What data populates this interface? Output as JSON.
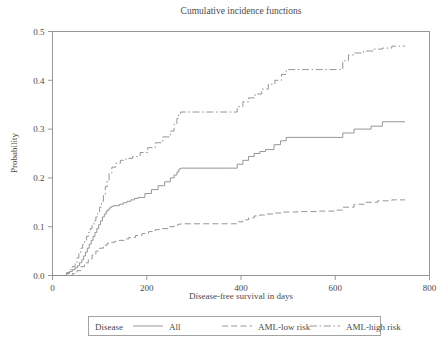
{
  "chart_data": {
    "type": "line",
    "title": "Cumulative incidence functions",
    "xlabel": "Disease-free survival in days",
    "ylabel": "Probability",
    "xlim": [
      0,
      800
    ],
    "ylim": [
      0.0,
      0.5
    ],
    "xticks": [
      0,
      200,
      400,
      600,
      800
    ],
    "xtick_labels": [
      "0",
      "200",
      "400",
      "600",
      "800"
    ],
    "yticks": [
      0.0,
      0.1,
      0.2,
      0.3,
      0.4,
      0.5
    ],
    "ytick_labels": [
      "0.0",
      "0.1",
      "0.2",
      "0.3",
      "0.4",
      "0.5"
    ],
    "grid": false,
    "legend_position": "below",
    "legend_title": "Disease",
    "series": [
      {
        "name": "All",
        "dash": "solid",
        "x": [
          0,
          22,
          30,
          36,
          42,
          48,
          53,
          57,
          62,
          66,
          70,
          74,
          78,
          82,
          86,
          90,
          94,
          98,
          102,
          106,
          110,
          114,
          118,
          122,
          126,
          130,
          136,
          142,
          150,
          158,
          166,
          174,
          182,
          196,
          210,
          224,
          238,
          250,
          258,
          264,
          268,
          272,
          380,
          392,
          404,
          416,
          428,
          440,
          452,
          470,
          484,
          496,
          604,
          616,
          640,
          676,
          700,
          748
        ],
        "y": [
          0.0,
          0.0,
          0.004,
          0.008,
          0.012,
          0.016,
          0.02,
          0.026,
          0.032,
          0.04,
          0.048,
          0.056,
          0.064,
          0.072,
          0.08,
          0.088,
          0.096,
          0.104,
          0.112,
          0.12,
          0.126,
          0.132,
          0.136,
          0.14,
          0.142,
          0.143,
          0.143,
          0.146,
          0.149,
          0.152,
          0.155,
          0.158,
          0.16,
          0.168,
          0.176,
          0.184,
          0.192,
          0.2,
          0.206,
          0.212,
          0.218,
          0.22,
          0.22,
          0.228,
          0.236,
          0.244,
          0.25,
          0.254,
          0.258,
          0.268,
          0.276,
          0.283,
          0.283,
          0.292,
          0.3,
          0.306,
          0.315,
          0.315
        ]
      },
      {
        "name": "AML-low risk",
        "dash": "dashed",
        "x": [
          0,
          30,
          42,
          52,
          60,
          68,
          76,
          84,
          92,
          100,
          108,
          116,
          124,
          132,
          142,
          152,
          162,
          176,
          190,
          204,
          218,
          232,
          246,
          258,
          266,
          272,
          380,
          392,
          404,
          416,
          428,
          440,
          452,
          470,
          490,
          520,
          560,
          600,
          616,
          640,
          664,
          690,
          720,
          748
        ],
        "y": [
          0.0,
          0.0,
          0.004,
          0.01,
          0.018,
          0.026,
          0.034,
          0.042,
          0.05,
          0.056,
          0.062,
          0.066,
          0.068,
          0.07,
          0.072,
          0.075,
          0.078,
          0.082,
          0.086,
          0.09,
          0.094,
          0.096,
          0.1,
          0.103,
          0.105,
          0.106,
          0.106,
          0.11,
          0.114,
          0.118,
          0.122,
          0.124,
          0.126,
          0.128,
          0.13,
          0.131,
          0.132,
          0.134,
          0.14,
          0.146,
          0.15,
          0.153,
          0.155,
          0.155
        ]
      },
      {
        "name": "AML-high risk",
        "dash": "dashdot",
        "x": [
          0,
          22,
          30,
          36,
          42,
          48,
          52,
          56,
          60,
          64,
          68,
          72,
          76,
          80,
          84,
          88,
          92,
          96,
          100,
          104,
          108,
          112,
          116,
          120,
          126,
          134,
          144,
          156,
          170,
          186,
          202,
          218,
          234,
          250,
          258,
          264,
          268,
          272,
          380,
          392,
          404,
          416,
          430,
          444,
          458,
          472,
          486,
          496,
          604,
          616,
          628,
          640,
          660,
          680,
          700,
          720,
          748
        ],
        "y": [
          0.0,
          0.0,
          0.006,
          0.012,
          0.018,
          0.026,
          0.036,
          0.046,
          0.056,
          0.064,
          0.072,
          0.08,
          0.088,
          0.096,
          0.104,
          0.112,
          0.12,
          0.13,
          0.14,
          0.152,
          0.166,
          0.182,
          0.196,
          0.21,
          0.222,
          0.23,
          0.236,
          0.24,
          0.244,
          0.252,
          0.262,
          0.272,
          0.284,
          0.296,
          0.31,
          0.322,
          0.33,
          0.335,
          0.335,
          0.346,
          0.356,
          0.364,
          0.372,
          0.382,
          0.392,
          0.4,
          0.412,
          0.422,
          0.422,
          0.44,
          0.452,
          0.456,
          0.46,
          0.464,
          0.466,
          0.47,
          0.47
        ]
      }
    ]
  },
  "legend": {
    "title": "Disease",
    "entries": [
      {
        "label": "All",
        "dash": "solid"
      },
      {
        "label": "AML-low risk",
        "dash": "dashed"
      },
      {
        "label": "AML-high risk",
        "dash": "dashdot"
      }
    ]
  },
  "colors": {
    "line": "#8a8a8a",
    "axis": "#8d8d8d",
    "text": "#4a4a4a",
    "background": "#ffffff"
  }
}
